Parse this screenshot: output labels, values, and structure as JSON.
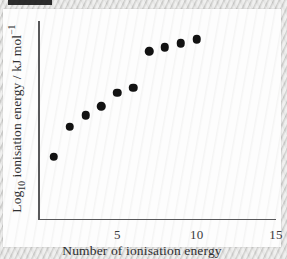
{
  "figure": {
    "background_color": "#d8d8d6",
    "card_color": "#fdfdfd",
    "point_color": "#121212",
    "axis_color": "#58585a"
  },
  "chart_data": {
    "type": "scatter",
    "title": "",
    "xlabel": "Number of ionisation energy",
    "ylabel": "Log10 ionisation energy / kJ mol-1",
    "ylabel_parts": {
      "prefix": "Log",
      "subscript": "10",
      "middle": " ionisation energy / kJ mol",
      "superscript": "−1"
    },
    "xlim": [
      0,
      15
    ],
    "ylim": [
      0,
      6
    ],
    "grid": false,
    "legend": null,
    "x_tick_labels": [
      "5",
      "10",
      "15"
    ],
    "x_tick_label_values": [
      5,
      10,
      15
    ],
    "x_minor_ticks": [
      1,
      2,
      3,
      4,
      5,
      6,
      7,
      8,
      9,
      10,
      11,
      12,
      13,
      14,
      15
    ],
    "y_tick_labels": [],
    "y_tick_count": 6,
    "x": [
      1,
      2,
      3,
      4,
      5,
      6,
      7,
      8,
      9,
      10
    ],
    "y": [
      1.88,
      2.79,
      3.13,
      3.41,
      3.82,
      3.97,
      5.08,
      5.21,
      5.33,
      5.45
    ],
    "points": [
      {
        "n": 1,
        "x": 1,
        "y": 1.88
      },
      {
        "n": 2,
        "x": 2,
        "y": 2.79
      },
      {
        "n": 3,
        "x": 3,
        "y": 3.13
      },
      {
        "n": 4,
        "x": 4,
        "y": 3.41
      },
      {
        "n": 5,
        "x": 5,
        "y": 3.82
      },
      {
        "n": 6,
        "x": 6,
        "y": 3.97
      },
      {
        "n": 7,
        "x": 7,
        "y": 5.08
      },
      {
        "n": 8,
        "x": 8,
        "y": 5.21
      },
      {
        "n": 9,
        "x": 9,
        "y": 5.33
      },
      {
        "n": 10,
        "x": 10,
        "y": 5.45
      }
    ]
  }
}
